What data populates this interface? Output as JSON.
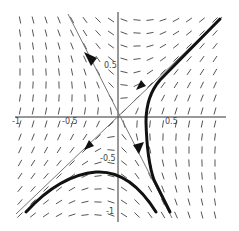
{
  "figure": {
    "type": "phase_portrait",
    "colors": {
      "background": "#ffffff",
      "field": "#555555",
      "axes": "#333333",
      "separatrix": "#777777",
      "trajectory": "#111111"
    }
  },
  "axes": {
    "x_ticks": [
      {
        "value": -1,
        "label": "-1"
      },
      {
        "value": -0.5,
        "label": "-0.5"
      },
      {
        "value": 0.5,
        "label": "0.5"
      }
    ],
    "y_ticks": [
      {
        "value": 0.5,
        "label": "0.5"
      },
      {
        "value": -0.5,
        "label": "-0.5"
      },
      {
        "value": -1,
        "label": "-1"
      }
    ],
    "xlim": [
      -1,
      1
    ],
    "ylim": [
      -1,
      1
    ]
  },
  "chart_data": {
    "type": "vector_field",
    "title": "",
    "xlabel": "",
    "ylabel": "",
    "xlim": [
      -1,
      1
    ],
    "ylim": [
      -1,
      1
    ],
    "grid": false,
    "equilibrium": {
      "x": 0,
      "y": 0,
      "kind": "saddle"
    },
    "separatrices": [
      {
        "name": "stable",
        "slope": -2,
        "direction": "toward-origin-from-top-left-to-bottom-right-arrows-up-left"
      },
      {
        "name": "unstable",
        "slope": 1,
        "direction": "away-from-origin-up-right"
      }
    ],
    "trajectories": [
      {
        "name": "upper-right",
        "points": [
          [
            0.95,
            0.95
          ],
          [
            0.6,
            0.6
          ],
          [
            0.3,
            0.15
          ],
          [
            0.28,
            0
          ],
          [
            0.3,
            -0.5
          ],
          [
            0.45,
            -0.95
          ]
        ]
      },
      {
        "name": "lower-left",
        "points": [
          [
            -0.9,
            -0.95
          ],
          [
            -0.5,
            -0.65
          ],
          [
            -0.15,
            -0.55
          ],
          [
            0.15,
            -0.65
          ],
          [
            0.35,
            -0.95
          ]
        ]
      }
    ]
  }
}
